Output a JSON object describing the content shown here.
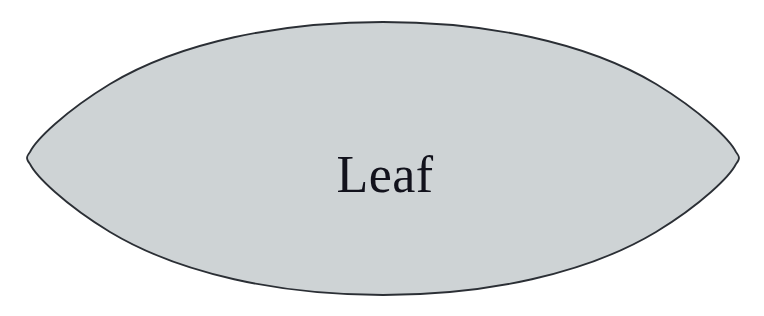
{
  "canvas": {
    "width": 764,
    "height": 316,
    "background_color": "#ffffff"
  },
  "diagram": {
    "type": "single-shape",
    "shape_name": "leaf",
    "shape_geometry": "vesica-lens",
    "label": "Leaf",
    "fill_color": "#ced3d5",
    "stroke_color": "#2b2f35",
    "stroke_width": 1.8,
    "text_color": "#12121c",
    "font_size_px": 52,
    "text_anchor_x": 385,
    "text_baseline_y": 192,
    "left_tip": {
      "x": 28,
      "y": 158
    },
    "right_tip": {
      "x": 737,
      "y": 158
    },
    "top_apex": {
      "x": 383,
      "y": 22
    },
    "bottom_apex": {
      "x": 383,
      "y": 295
    },
    "tip_radius": 10
  }
}
